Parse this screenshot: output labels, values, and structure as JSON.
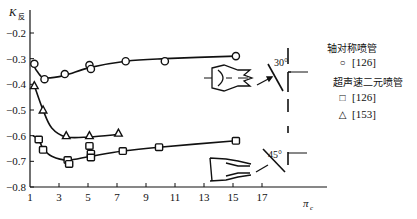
{
  "chart_data": {
    "type": "line",
    "title": "",
    "xlabel": "π_c",
    "ylabel": "K_反",
    "xlim": [
      1,
      18
    ],
    "ylim": [
      -0.8,
      -0.15
    ],
    "x_ticks": [
      "1",
      "3",
      "5",
      "7",
      "9",
      "11",
      "13",
      "15",
      "17"
    ],
    "y_ticks": [
      "-0.2",
      "-0.3",
      "-0.4",
      "-0.5",
      "-0.6",
      "-0.7",
      "-0.8"
    ],
    "grid": false,
    "legend_position": "right",
    "series": [
      {
        "name": "轴对称喷管 [126]",
        "marker": "circle",
        "points": [
          [
            1.3,
            -0.32
          ],
          [
            2.0,
            -0.38
          ],
          [
            3.4,
            -0.36
          ],
          [
            5.1,
            -0.325
          ],
          [
            5.2,
            -0.34
          ],
          [
            7.6,
            -0.31
          ],
          [
            10.3,
            -0.31
          ],
          [
            15.2,
            -0.29
          ]
        ],
        "curve": [
          [
            1.2,
            -0.32
          ],
          [
            1.5,
            -0.35
          ],
          [
            2.0,
            -0.375
          ],
          [
            3.4,
            -0.365
          ],
          [
            5.1,
            -0.335
          ],
          [
            7.6,
            -0.31
          ],
          [
            10.3,
            -0.3
          ],
          [
            15.2,
            -0.29
          ]
        ]
      },
      {
        "name": "超声速二元喷管 [126]",
        "marker": "square",
        "points": [
          [
            1.6,
            -0.615
          ],
          [
            1.9,
            -0.655
          ],
          [
            3.6,
            -0.695
          ],
          [
            3.7,
            -0.71
          ],
          [
            5.1,
            -0.64
          ],
          [
            5.2,
            -0.67
          ],
          [
            5.2,
            -0.685
          ],
          [
            7.4,
            -0.66
          ],
          [
            9.9,
            -0.645
          ],
          [
            15.2,
            -0.62
          ]
        ],
        "curve": [
          [
            1.2,
            -0.6
          ],
          [
            1.6,
            -0.615
          ],
          [
            1.9,
            -0.65
          ],
          [
            2.5,
            -0.68
          ],
          [
            3.6,
            -0.695
          ],
          [
            5.2,
            -0.68
          ],
          [
            7.4,
            -0.66
          ],
          [
            9.9,
            -0.645
          ],
          [
            15.2,
            -0.62
          ]
        ]
      },
      {
        "name": "[153]",
        "marker": "triangle",
        "points": [
          [
            1.3,
            -0.405
          ],
          [
            1.9,
            -0.5
          ],
          [
            3.5,
            -0.6
          ],
          [
            5.1,
            -0.6
          ],
          [
            7.1,
            -0.59
          ]
        ],
        "curve": [
          [
            1.3,
            -0.405
          ],
          [
            1.9,
            -0.5
          ],
          [
            2.5,
            -0.57
          ],
          [
            3.5,
            -0.605
          ],
          [
            5.1,
            -0.605
          ],
          [
            7.1,
            -0.595
          ]
        ]
      }
    ],
    "annotations": [
      "30°",
      "45°"
    ]
  },
  "legend": {
    "group1_title": "轴对称喷管",
    "group1_entries": [
      {
        "symbol": "○",
        "label": "[126]"
      }
    ],
    "group2_title": "超声速二元喷管",
    "group2_entries": [
      {
        "symbol": "□",
        "label": "[126]"
      },
      {
        "symbol": "△",
        "label": "[153]"
      }
    ]
  },
  "axis": {
    "y_title": "K",
    "y_title_sub": "反",
    "x_title": "π",
    "x_title_sub": "c"
  },
  "annotations": {
    "angle_top": "30°",
    "angle_bottom": "45°"
  }
}
